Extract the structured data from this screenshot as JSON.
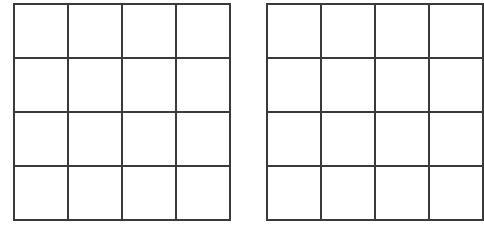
{
  "diagram": {
    "grids": [
      {
        "id": "left",
        "rows": 4,
        "cols": 4,
        "line_color": "#3a3a3a"
      },
      {
        "id": "right",
        "rows": 4,
        "cols": 4,
        "line_color": "#3a3a3a",
        "clipped_right": true
      }
    ]
  }
}
